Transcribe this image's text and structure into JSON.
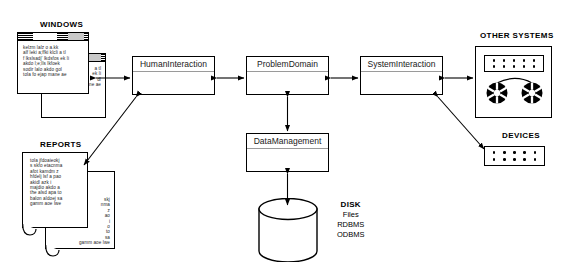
{
  "diagram": {
    "background": "#ffffff",
    "line_color": "#000000"
  },
  "captions": {
    "windows": "WINDOWS",
    "reports": "REPORTS",
    "other_systems": "OTHER SYSTEMS",
    "devices": "DEVICES"
  },
  "components": {
    "human_interaction": "HumanInteraction",
    "problem_domain": "ProblemDomain",
    "system_interaction": "SystemInteraction",
    "data_management": "DataManagement"
  },
  "disk": {
    "heading": "DISK",
    "lines": [
      "Files",
      "RDBMS",
      "ODBMS"
    ],
    "line1": "Files",
    "line2": "RDBMS",
    "line3": "ODBMS"
  },
  "windows_text": {
    "front": "kelzm lalz o a.kk\nalf leki a;ffki klcli a tl\nf lkslsadj' lkdsfos ek li\nakdo l;e;lls lkfoek\nsodir lalo akdo gol\ntola fo ejap mane ae",
    "back": "a tl\nek li\ndl\ntola fo ejap mane ae"
  },
  "reports_text": {
    "front": "tola jfdoaieokj\ns skfo etacnma\nafot kamdm z\nhfdelj lsf a pao\nakidl azk i\nmajdio akdo a\nthe alsd apa to\nbalon aldoej sa\ngamm aoe lwe",
    "back": "skj\nnma\nz\nao\ni\no\nto\nsa\ngamm aoe lwe"
  },
  "icons": {
    "tape_reel": "tape-reel-icon",
    "dot_grid": "dot-grid-icon",
    "disk_cylinder": "disk-cylinder-icon",
    "curl": "page-curl-icon"
  }
}
